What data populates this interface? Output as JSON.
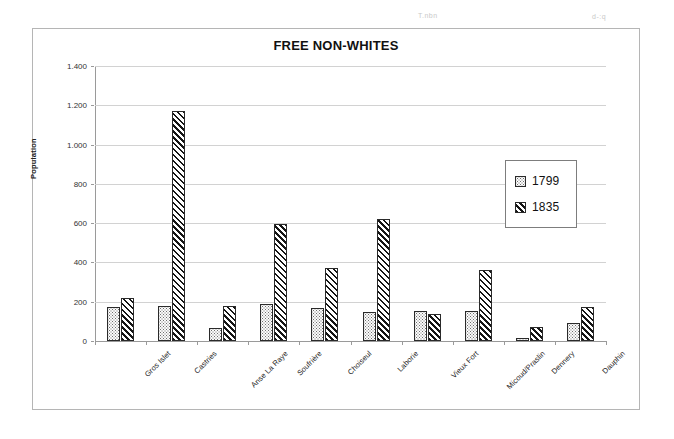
{
  "page": {
    "artifact_left": "T.nbn",
    "artifact_right": "d-:q"
  },
  "chart_data": {
    "type": "bar",
    "title": "FREE NON-WHITES",
    "xlabel": "",
    "ylabel": "Population",
    "ylim": [
      0,
      1400
    ],
    "ytick_labels": [
      "0",
      "200",
      "400",
      "600",
      "800",
      "1.000",
      "1.200",
      "1.400"
    ],
    "ytick_values": [
      0,
      200,
      400,
      600,
      800,
      1000,
      1200,
      1400
    ],
    "grid": true,
    "legend_position": "right-inside",
    "categories": [
      "Gros Islet",
      "Castries",
      "Anse La Raye",
      "Soufrière",
      "Choiseul",
      "Laborie",
      "Vieux Fort",
      "Micoud/Praslin",
      "Dennery",
      "Dauphin"
    ],
    "series": [
      {
        "name": "1799",
        "pattern": "dotted",
        "values": [
          175,
          178,
          65,
          190,
          168,
          148,
          155,
          155,
          15,
          90
        ]
      },
      {
        "name": "1835",
        "pattern": "diagonal-hatch",
        "values": [
          218,
          1170,
          178,
          595,
          370,
          620,
          135,
          360,
          70,
          175
        ]
      }
    ]
  },
  "colors": {
    "frame": "#b5b5b5",
    "axis": "#9a9a9a",
    "gridline": "#d2d2d2",
    "bar_outline": "#2a2a2a",
    "text": "#1a1a1a"
  }
}
